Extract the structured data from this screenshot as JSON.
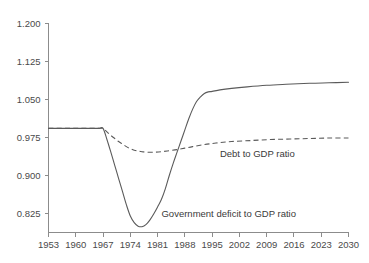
{
  "chart_data": {
    "type": "line",
    "title": "",
    "subtitle": "",
    "xlabel": "",
    "ylabel": "",
    "grid": false,
    "legend_position": "inline-annotation",
    "xlim": [
      1953,
      2030
    ],
    "ylim": [
      0.7875,
      1.2
    ],
    "x_ticks": [
      1953,
      1960,
      1967,
      1974,
      1981,
      1988,
      1995,
      2002,
      2009,
      2016,
      2023,
      2030
    ],
    "x_tick_labels": [
      "1953",
      "1960",
      "1967",
      "1974",
      "1981",
      "1988",
      "1995",
      "2002",
      "2009",
      "2016",
      "2023",
      "2030"
    ],
    "y_ticks": [
      0.825,
      0.9,
      0.975,
      1.05,
      1.125,
      1.2
    ],
    "y_tick_labels": [
      "0.825",
      "0.900",
      "0.975",
      "1.050",
      "1.125",
      "1.200"
    ],
    "series": [
      {
        "name": "Government deficit to GDP ratio",
        "style": "solid",
        "color": "#5a5a5a",
        "x": [
          1953,
          1958,
          1962,
          1965,
          1966,
          1967,
          1968,
          1969,
          1970,
          1971,
          1972,
          1973,
          1974,
          1975,
          1976,
          1977,
          1978,
          1979,
          1980,
          1981,
          1982,
          1983,
          1984,
          1985,
          1986,
          1987,
          1988,
          1989,
          1990,
          1991,
          1992,
          1993,
          1994,
          1995,
          1997,
          2000,
          2004,
          2009,
          2014,
          2020,
          2025,
          2030
        ],
        "y": [
          0.993,
          0.993,
          0.993,
          0.993,
          0.993,
          0.993,
          0.971,
          0.946,
          0.92,
          0.894,
          0.868,
          0.842,
          0.82,
          0.807,
          0.8,
          0.799,
          0.803,
          0.812,
          0.824,
          0.838,
          0.853,
          0.874,
          0.9,
          0.924,
          0.946,
          0.968,
          0.99,
          1.012,
          1.031,
          1.046,
          1.055,
          1.062,
          1.065,
          1.066,
          1.069,
          1.072,
          1.075,
          1.078,
          1.08,
          1.082,
          1.083,
          1.084
        ],
        "annotation": {
          "text": "Government deficit to GDP ratio",
          "x": 1982,
          "y": 0.819
        }
      },
      {
        "name": "Debt to GDP ratio",
        "style": "dashed",
        "color": "#5a5a5a",
        "x": [
          1953,
          1958,
          1962,
          1965,
          1966,
          1967,
          1968,
          1969,
          1970,
          1971,
          1972,
          1973,
          1974,
          1975,
          1976,
          1977,
          1978,
          1980,
          1982,
          1984,
          1986,
          1988,
          1990,
          1993,
          1996,
          2000,
          2005,
          2010,
          2015,
          2020,
          2025,
          2030
        ],
        "y": [
          0.993,
          0.993,
          0.993,
          0.993,
          0.993,
          0.993,
          0.986,
          0.979,
          0.973,
          0.967,
          0.962,
          0.957,
          0.953,
          0.95,
          0.948,
          0.947,
          0.946,
          0.946,
          0.947,
          0.949,
          0.951,
          0.954,
          0.957,
          0.961,
          0.964,
          0.967,
          0.969,
          0.971,
          0.972,
          0.973,
          0.974,
          0.974
        ],
        "annotation": {
          "text": "Debt to GDP ratio",
          "x": 1997,
          "y": 0.937
        }
      }
    ],
    "annotations": [
      {
        "name": "debt-to-gdp-ratio-label",
        "text": "Debt to GDP ratio"
      },
      {
        "name": "government-deficit-to-gdp-ratio-label",
        "text": "Government deficit to GDP ratio"
      }
    ],
    "colors": {
      "axis": "#8c8c8c",
      "text": "#3a3a3a",
      "line": "#5a5a5a",
      "background": "#ffffff"
    }
  }
}
